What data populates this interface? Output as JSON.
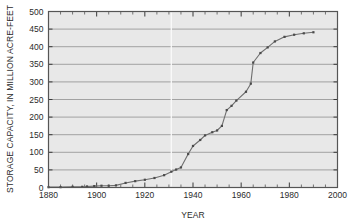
{
  "chart_data": {
    "type": "line",
    "title": "",
    "xlabel": "YEAR",
    "ylabel": "STORAGE CAPACITY, IN MILLION ACRE-FEET",
    "xlim": [
      1880,
      2000
    ],
    "ylim": [
      0,
      500
    ],
    "xticks": [
      1880,
      1900,
      1920,
      1940,
      1960,
      1980,
      2000
    ],
    "xtick_labels": [
      "1880",
      "1900",
      "1920",
      "1940",
      "1960",
      "1980",
      "2000"
    ],
    "x_minor_interval": 5,
    "yticks": [
      0,
      50,
      100,
      150,
      200,
      250,
      300,
      350,
      400,
      450,
      500
    ],
    "ytick_labels": [
      "0",
      "50",
      "100",
      "150",
      "200",
      "250",
      "300",
      "350",
      "400",
      "450",
      "500"
    ],
    "grid": "horizontal",
    "legend": "none",
    "line_color": "#6e6e6e",
    "marker_color": "#4a4a4a",
    "plot_background": "#e8e8e8",
    "frame_color": "#555555",
    "gridline_color": "#8f8f8f",
    "series": [
      {
        "name": "Reservoir storage capacity",
        "x": [
          1880,
          1885,
          1890,
          1894,
          1896,
          1899,
          1902,
          1905,
          1908,
          1912,
          1916,
          1920,
          1924,
          1928,
          1931,
          1933,
          1935,
          1938,
          1940,
          1943,
          1945,
          1948,
          1950,
          1952,
          1954,
          1956,
          1958,
          1962,
          1964,
          1965,
          1968,
          1971,
          1974,
          1978,
          1982,
          1986,
          1990
        ],
        "values": [
          1,
          1,
          2,
          2,
          3,
          4,
          5,
          5,
          6,
          13,
          18,
          22,
          27,
          35,
          45,
          51,
          57,
          95,
          118,
          135,
          148,
          157,
          162,
          175,
          220,
          232,
          247,
          272,
          295,
          355,
          382,
          398,
          415,
          428,
          434,
          438,
          441
        ]
      }
    ]
  },
  "annotations": {
    "vertical_artifact_year": 1931
  }
}
